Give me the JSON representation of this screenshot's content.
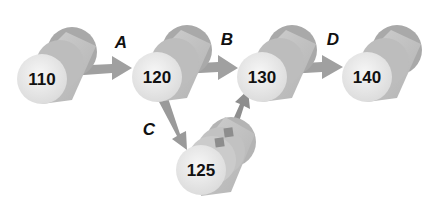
{
  "diagram": {
    "type": "version-graph",
    "colors": {
      "background": "#ffffff",
      "cylinder_back": "#a9a9a9",
      "cylinder_body": "#c4c4c4",
      "cylinder_face": "#ececec",
      "arrow": "#9a9a9a",
      "text": "#111111"
    },
    "nodes": [
      {
        "id": "n110",
        "label": "110"
      },
      {
        "id": "n120",
        "label": "120"
      },
      {
        "id": "n130",
        "label": "130"
      },
      {
        "id": "n140",
        "label": "140"
      },
      {
        "id": "n125",
        "label": "125"
      }
    ],
    "edges": [
      {
        "from": "110",
        "to": "120",
        "label": "A"
      },
      {
        "from": "120",
        "to": "130",
        "label": "B"
      },
      {
        "from": "120",
        "to": "125",
        "label": "C"
      },
      {
        "from": "130",
        "to": "140",
        "label": "D"
      },
      {
        "from": "125",
        "to": "130",
        "label": ""
      }
    ]
  }
}
